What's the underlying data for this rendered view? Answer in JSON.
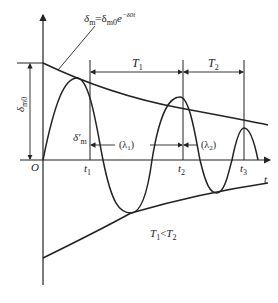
{
  "diagram": {
    "envelope_label": {
      "lhs": "δ",
      "lhs_sub": "m",
      "eq": "=δ",
      "rhs_sub": "m0",
      "exp_base": "e",
      "exponent": "−δ0t"
    },
    "axis_origin": "O",
    "axis_t": "t",
    "amplitude_label": "δ",
    "amplitude_sub": "m0",
    "second_amplitude_label": "δ′",
    "second_amplitude_sub": "m",
    "time_marks": [
      "t1",
      "t2",
      "t3"
    ],
    "time_mark_main": [
      "t",
      "t",
      "t"
    ],
    "time_mark_sub": [
      "1",
      "2",
      "3"
    ],
    "periods": [
      {
        "main": "T",
        "sub": "1"
      },
      {
        "main": "T",
        "sub": "2"
      }
    ],
    "wavelengths": [
      {
        "text": "(λ",
        "sub": "1",
        "close": ")"
      },
      {
        "text": "(λ",
        "sub": "2",
        "close": ")"
      }
    ],
    "condition": {
      "a": "T",
      "a_sub": "1",
      "op": "<",
      "b": "T",
      "b_sub": "2"
    },
    "colors": {
      "stroke": "#222222",
      "background": "#ffffff"
    }
  }
}
